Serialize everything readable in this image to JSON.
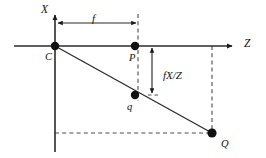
{
  "figure": {
    "type": "geometry-diagram",
    "background_color": "#ffffff",
    "stroke_color": "#1a1a1a",
    "dash_color": "#555555",
    "width": 266,
    "height": 158
  },
  "axes": [
    {
      "id": "x-axis",
      "label": "X",
      "orientation": "vertical",
      "direction": "up",
      "x": 55,
      "y_top": 14,
      "y_bottom": 152,
      "label_x": 41,
      "label_y": 12,
      "arrow": true
    },
    {
      "id": "z-axis",
      "label": "Z",
      "orientation": "horizontal",
      "direction": "right",
      "y": 46,
      "x_left": 14,
      "x_right": 233,
      "label_x": 244,
      "label_y": 47,
      "arrow": true
    }
  ],
  "points": [
    {
      "id": "point-c",
      "label": "C",
      "x": 55,
      "y": 46,
      "r": 4.2,
      "label_x": 45,
      "label_y": 60,
      "description": "camera centre at origin"
    },
    {
      "id": "point-p",
      "label": "P",
      "x": 135,
      "y": 46,
      "r": 4.2,
      "label_x": 129,
      "label_y": 61,
      "description": "principal point on image plane"
    },
    {
      "id": "point-q",
      "label": "q",
      "x": 135,
      "y": 95,
      "r": 4.2,
      "label_x": 127,
      "label_y": 110,
      "description": "projected image point"
    },
    {
      "id": "point-q-upper",
      "label": "Q",
      "x": 212,
      "y": 133,
      "r": 4.6,
      "label_x": 221,
      "label_y": 147,
      "description": "3D scene point"
    }
  ],
  "rays": [
    {
      "id": "ray-c-to-Q",
      "from": {
        "x": 55,
        "y": 46
      },
      "to": {
        "x": 212,
        "y": 133
      },
      "style": "solid"
    }
  ],
  "dashed_lines": [
    {
      "id": "image-plane-line",
      "x1": 138,
      "y1": 14,
      "x2": 138,
      "y2": 101,
      "style": "dashed"
    },
    {
      "id": "Q-vertical-drop",
      "x1": 212,
      "y1": 46,
      "x2": 212,
      "y2": 133,
      "style": "dashed"
    },
    {
      "id": "Q-horizontal-to-axis",
      "x1": 55,
      "y1": 133,
      "x2": 212,
      "y2": 133,
      "style": "dashed"
    },
    {
      "id": "q-tick-marker",
      "x1": 147,
      "y1": 95,
      "x2": 157,
      "y2": 95,
      "style": "dashed"
    }
  ],
  "measures": [
    {
      "id": "focal-length-measure",
      "label": "f",
      "orientation": "horizontal",
      "y": 23,
      "x_start": 56,
      "x_end": 138,
      "label_x": 92,
      "label_y": 22,
      "double_headed": true,
      "description": "focal length from C to image plane"
    },
    {
      "id": "image-height-measure",
      "label": "fX/Z",
      "orientation": "vertical",
      "x": 152,
      "y_start": 46,
      "y_end": 95,
      "label_x": 163,
      "label_y": 79,
      "double_headed": true,
      "description": "projected image coordinate"
    }
  ]
}
